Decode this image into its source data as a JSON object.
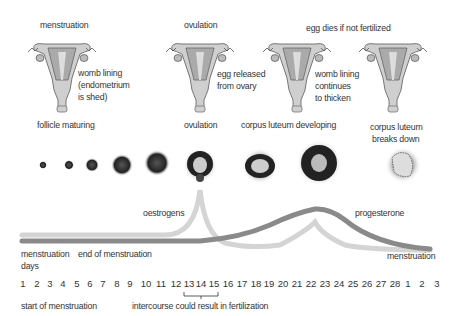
{
  "stages": [
    {
      "top_label": "menstruation",
      "side_label": [
        "womb lining",
        "(endometrium",
        "is shed)"
      ],
      "bottom_label": "follicle maturing"
    },
    {
      "top_label": "ovulation",
      "side_label": [
        "egg released",
        "from ovary"
      ],
      "bottom_label": "ovulation"
    },
    {
      "top_label": "egg dies if not fertilized",
      "side_label": [
        "womb lining",
        "continues",
        "to thicken"
      ],
      "bottom_label": "corpus luteum developing"
    },
    {
      "top_label": "",
      "side_label": [],
      "bottom_label": [
        "corpus luteum",
        "breaks down"
      ]
    }
  ],
  "hormones": {
    "oestrogens": {
      "label": "oestrogens",
      "color": "#d4d4d4"
    },
    "progesterone": {
      "label": "progesterone",
      "color": "#8a8a8a"
    }
  },
  "timeline": {
    "menstruation_start_label": "menstruation",
    "days_label": "days",
    "end_of_menstruation_label": "end of menstruation",
    "menstruation_end_label": "menstruation",
    "days": [
      "1",
      "2",
      "3",
      "4",
      "5",
      "6",
      "7",
      "8",
      "9",
      "10",
      "11",
      "12",
      "13",
      "14",
      "15",
      "16",
      "17",
      "18",
      "19",
      "20",
      "21",
      "22",
      "23",
      "24",
      "25",
      "26",
      "27",
      "28",
      "1",
      "2",
      "3"
    ],
    "start_label": "start of menstruation",
    "fertile_window": {
      "from": "13",
      "to": "15",
      "label": "intercourse could result in fertilization"
    }
  }
}
